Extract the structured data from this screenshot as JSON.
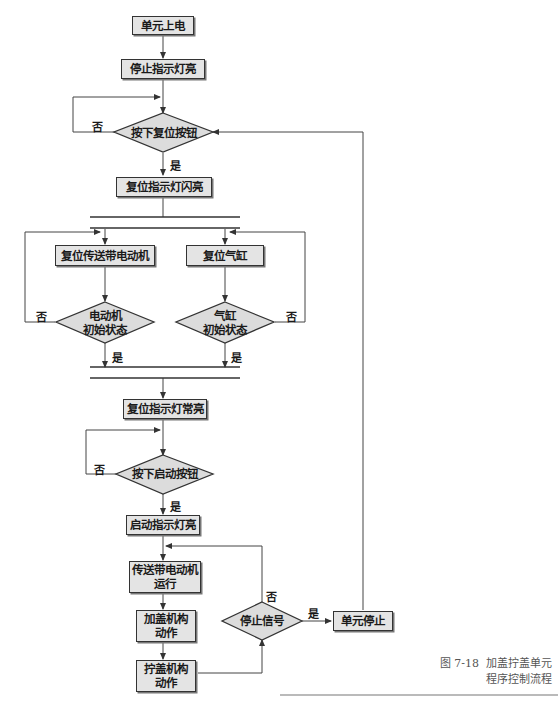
{
  "figure": {
    "caption_number": "图 7-18",
    "caption_line1": "加盖拧盖单元",
    "caption_line2": "程序控制流程"
  },
  "nodes": {
    "power_on": "单元上电",
    "stop_light_on": "停止指示灯亮",
    "press_reset": "按下复位按钮",
    "reset_light_blink": "复位指示灯闪亮",
    "reset_motor": "复位传送带电动机",
    "reset_cylinder": "复位气缸",
    "motor_initial_l1": "电动机",
    "motor_initial_l2": "初始状态",
    "cylinder_initial_l1": "气缸",
    "cylinder_initial_l2": "初始状态",
    "reset_light_steady": "复位指示灯常亮",
    "press_start": "按下启动按钮",
    "start_light_on": "启动指示灯亮",
    "conveyor_run_l1": "传送带电动机",
    "conveyor_run_l2": "运行",
    "capping_l1": "加盖机构",
    "capping_l2": "动作",
    "screwing_l1": "拧盖机构",
    "screwing_l2": "动作",
    "stop_signal": "停止信号",
    "unit_stop": "单元停止"
  },
  "labels": {
    "yes": "是",
    "no": "否"
  },
  "colors": {
    "box_fill": "#e4e4e4",
    "diamond_fill": "#dcdcdc",
    "line": "#333333",
    "caption": "#555555"
  }
}
